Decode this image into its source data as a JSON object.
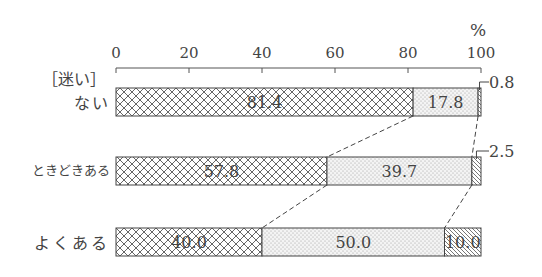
{
  "chart_data": {
    "type": "bar",
    "orientation": "horizontal",
    "stacked": true,
    "title": "",
    "unit_label": "%",
    "row_header": "[迷い]",
    "xlim": [
      0,
      100
    ],
    "xticks": [
      0,
      20,
      40,
      60,
      80,
      100
    ],
    "categories": [
      "ない",
      "ときどきある",
      "よくある"
    ],
    "series": [
      {
        "name": "segment-1",
        "pattern": "crosshatch",
        "values": [
          81.4,
          57.8,
          40.0
        ]
      },
      {
        "name": "segment-2",
        "pattern": "dots",
        "values": [
          17.8,
          39.7,
          50.0
        ]
      },
      {
        "name": "segment-3",
        "pattern": "diagonal",
        "values": [
          0.8,
          2.5,
          10.0
        ]
      }
    ],
    "callouts": [
      "0.8",
      "2.5"
    ],
    "connector_lines": "dashed",
    "grid": false,
    "legend": "none"
  },
  "labels": {
    "percent": "%",
    "header": "［迷い］",
    "rows": [
      "ない",
      "ときどきある",
      "よくある"
    ]
  }
}
